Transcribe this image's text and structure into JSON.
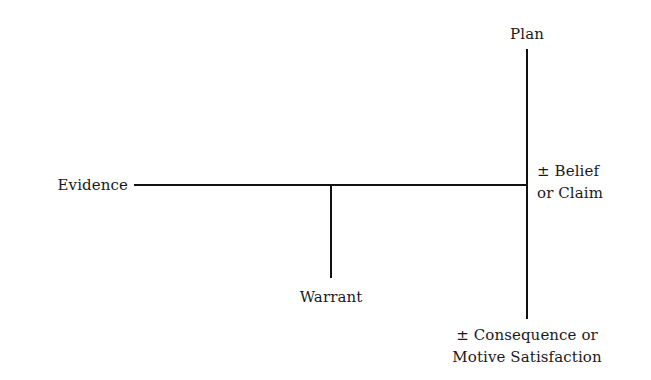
{
  "diagram": {
    "type": "toulmin-style argument structure",
    "nodes": {
      "plan": {
        "label": "Plan"
      },
      "evidence": {
        "label": "Evidence"
      },
      "belief": {
        "line1": "± Belief",
        "line2": "or Claim"
      },
      "warrant": {
        "label": "Warrant"
      },
      "consequence": {
        "line1": "± Consequence or",
        "line2": "Motive Satisfaction"
      }
    },
    "edges": [
      {
        "from": "evidence",
        "to": "belief",
        "orientation": "horizontal"
      },
      {
        "from": "warrant",
        "to": "evidence-belief-line",
        "orientation": "vertical"
      },
      {
        "from": "plan",
        "to": "consequence",
        "orientation": "vertical",
        "passes_through": "belief"
      }
    ],
    "colors": {
      "line": "#111111",
      "text": "#1a1a1a",
      "background": "#ffffff"
    }
  }
}
